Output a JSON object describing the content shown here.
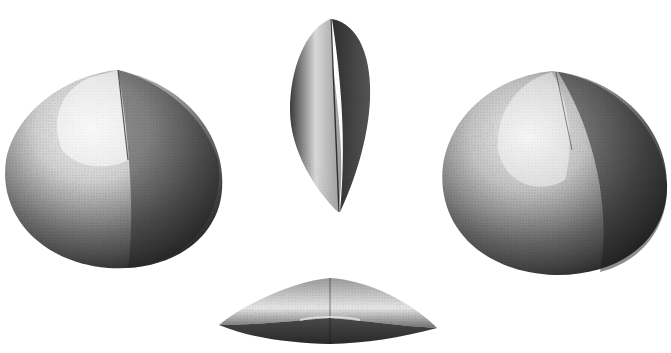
{
  "plate": {
    "subject": "Bivalve shell engraving, four views",
    "background": "#ffffff",
    "ink": "#1a1a1a",
    "figures": [
      {
        "name": "left-valve-view",
        "x": 5,
        "y": 70,
        "w": 218,
        "h": 200
      },
      {
        "name": "side-profile-view",
        "x": 287,
        "y": 18,
        "w": 86,
        "h": 196
      },
      {
        "name": "right-valve-view",
        "x": 440,
        "y": 70,
        "w": 228,
        "h": 206
      },
      {
        "name": "ventral-edge-view",
        "x": 218,
        "y": 276,
        "w": 222,
        "h": 66
      }
    ]
  }
}
